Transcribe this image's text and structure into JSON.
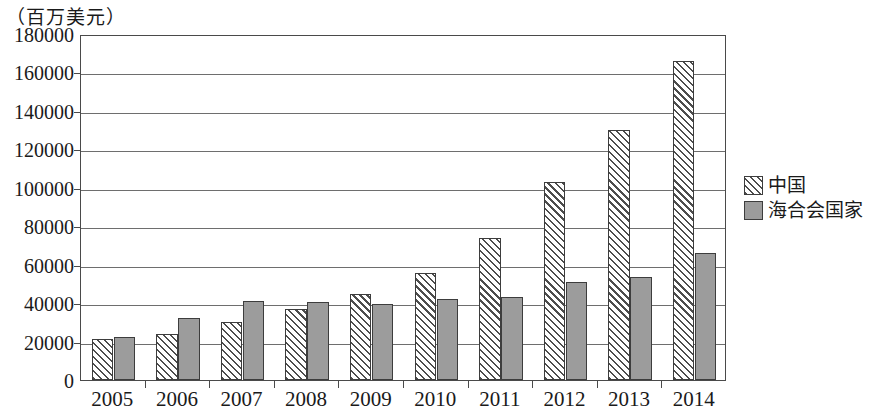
{
  "chart_data": {
    "type": "bar",
    "title": "（百万美元）",
    "xlabel": "",
    "ylabel": "（百万美元）",
    "ylim": [
      0,
      180000
    ],
    "ytick_step": 20000,
    "yticks": [
      "180000",
      "160000",
      "140000",
      "120000",
      "100000",
      "80000",
      "60000",
      "40000",
      "20000",
      "0"
    ],
    "grid": true,
    "legend_position": "right",
    "categories": [
      "2005",
      "2006",
      "2007",
      "2008",
      "2009",
      "2010",
      "2011",
      "2012",
      "2013",
      "2014"
    ],
    "series": [
      {
        "name": "中国",
        "fill": "diagonal-hatch",
        "color": "#4d4d4d",
        "values": [
          21500,
          24000,
          30000,
          37000,
          45000,
          55500,
          74000,
          103000,
          130000,
          166000
        ]
      },
      {
        "name": "海合会国家",
        "fill": "solid-gray",
        "color": "#9c9c9c",
        "values": [
          22500,
          32500,
          41000,
          40500,
          39500,
          42000,
          43000,
          51000,
          53500,
          66000
        ]
      }
    ]
  },
  "legend": {
    "items": [
      {
        "label": "中国",
        "swatch": "hatch-swatch-icon"
      },
      {
        "label": "海合会国家",
        "swatch": "solid-swatch-icon"
      }
    ]
  }
}
